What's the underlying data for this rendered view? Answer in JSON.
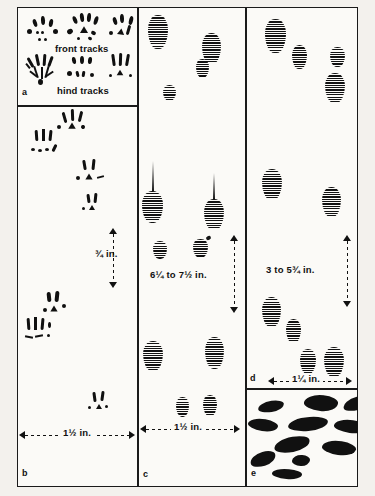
{
  "figure": {
    "background_color": "#f3f1ed",
    "ink_color": "#111111"
  },
  "panels": {
    "a": {
      "label": "a",
      "caption_front": "front tracks",
      "caption_hind": "hind tracks"
    },
    "b": {
      "label": "b",
      "dimension_vertical": "¾ in.",
      "dimension_horizontal": "1½ in."
    },
    "c": {
      "label": "c",
      "dimension_vertical": "6¼ to 7½ in.",
      "dimension_horizontal": "1½ in."
    },
    "d": {
      "label": "d",
      "dimension_vertical": "3 to 5¾ in.",
      "dimension_horizontal": "1¼ in."
    },
    "e": {
      "label": "e"
    }
  },
  "tracks": {
    "panel_a_front": [
      {
        "x": 14,
        "y": 6,
        "toes": [
          [
            2,
            0
          ],
          [
            9,
            -2
          ],
          [
            15,
            1
          ],
          [
            20,
            6
          ]
        ],
        "pad": [
          8,
          13
        ],
        "detail": "low"
      },
      {
        "x": 62,
        "y": 3,
        "toes": [
          [
            3,
            2
          ],
          [
            10,
            -2
          ],
          [
            17,
            -2
          ],
          [
            24,
            2
          ]
        ],
        "pad": [
          10,
          12
        ],
        "detail": "high"
      },
      {
        "x": 110,
        "y": 4,
        "toes": [
          [
            2,
            1
          ],
          [
            8,
            -3
          ],
          [
            15,
            -1
          ],
          [
            21,
            4
          ]
        ],
        "pad": [
          9,
          12
        ],
        "detail": "sparse"
      }
    ],
    "panel_a_hind": [
      {
        "x": 10,
        "y": 48,
        "type": "splayed-detail"
      },
      {
        "x": 60,
        "y": 50,
        "type": "toe-row"
      },
      {
        "x": 108,
        "y": 49,
        "type": "toe-row-bars"
      }
    ],
    "panel_b_groups": [
      {
        "x": 32,
        "y": 104
      },
      {
        "x": 82,
        "y": 160
      },
      {
        "x": 88,
        "y": 196
      },
      {
        "x": 22,
        "y": 292
      },
      {
        "x": 82,
        "y": 394
      }
    ],
    "panel_c_ovals": [
      {
        "x": 148,
        "y": 14,
        "w": 20,
        "h": 34,
        "tail": 0
      },
      {
        "x": 202,
        "y": 32,
        "w": 19,
        "h": 31,
        "tail": 0
      },
      {
        "x": 196,
        "y": 58,
        "w": 13,
        "h": 19,
        "tail": 0
      },
      {
        "x": 163,
        "y": 84,
        "w": 13,
        "h": 16,
        "tail": 0
      },
      {
        "x": 142,
        "y": 188,
        "w": 21,
        "h": 32,
        "tail": 26
      },
      {
        "x": 204,
        "y": 196,
        "w": 20,
        "h": 31,
        "tail": 22
      },
      {
        "x": 153,
        "y": 238,
        "w": 14,
        "h": 18,
        "tail": 0
      },
      {
        "x": 193,
        "y": 236,
        "w": 15,
        "h": 19,
        "tail": 0,
        "nub": true
      },
      {
        "x": 143,
        "y": 338,
        "w": 20,
        "h": 30,
        "tail": 0
      },
      {
        "x": 205,
        "y": 334,
        "w": 19,
        "h": 32,
        "tail": 0
      },
      {
        "x": 176,
        "y": 394,
        "w": 13,
        "h": 20,
        "tail": 0
      },
      {
        "x": 203,
        "y": 392,
        "w": 14,
        "h": 21,
        "tail": 0
      }
    ],
    "panel_d_ovals": [
      {
        "x": 265,
        "y": 18,
        "w": 21,
        "h": 34
      },
      {
        "x": 292,
        "y": 44,
        "w": 15,
        "h": 24
      },
      {
        "x": 330,
        "y": 46,
        "w": 15,
        "h": 20
      },
      {
        "x": 325,
        "y": 72,
        "w": 20,
        "h": 30
      },
      {
        "x": 262,
        "y": 168,
        "w": 20,
        "h": 31
      },
      {
        "x": 322,
        "y": 186,
        "w": 19,
        "h": 30
      },
      {
        "x": 262,
        "y": 296,
        "w": 19,
        "h": 30
      },
      {
        "x": 286,
        "y": 318,
        "w": 15,
        "h": 24
      },
      {
        "x": 300,
        "y": 348,
        "w": 16,
        "h": 25
      },
      {
        "x": 324,
        "y": 346,
        "w": 20,
        "h": 30
      }
    ],
    "panel_e_scat": [
      {
        "x": 12,
        "y": 12,
        "w": 26,
        "h": 11,
        "r": -8
      },
      {
        "x": 58,
        "y": 6,
        "w": 34,
        "h": 16,
        "r": 6
      },
      {
        "x": 100,
        "y": 8,
        "w": 28,
        "h": 13,
        "r": -14
      },
      {
        "x": 4,
        "y": 30,
        "w": 30,
        "h": 12,
        "r": 10
      },
      {
        "x": 42,
        "y": 28,
        "w": 40,
        "h": 14,
        "r": -4
      },
      {
        "x": 92,
        "y": 30,
        "w": 33,
        "h": 13,
        "r": 8
      },
      {
        "x": 30,
        "y": 48,
        "w": 36,
        "h": 15,
        "r": -10
      },
      {
        "x": 78,
        "y": 52,
        "w": 34,
        "h": 14,
        "r": 9
      },
      {
        "x": 6,
        "y": 66,
        "w": 26,
        "h": 14,
        "r": -16
      },
      {
        "x": 46,
        "y": 68,
        "w": 18,
        "h": 11,
        "r": 4
      },
      {
        "x": 26,
        "y": 84,
        "w": 30,
        "h": 10,
        "r": 6
      }
    ]
  }
}
